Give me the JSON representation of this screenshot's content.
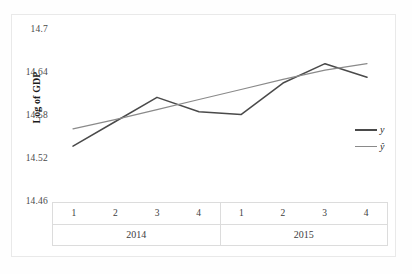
{
  "chart_data": {
    "type": "line",
    "title": "",
    "xlabel": "",
    "ylabel": "Log of GDP",
    "ylim": [
      14.46,
      14.7
    ],
    "yticks": [
      "14.7",
      "14.64",
      "14.58",
      "14.52",
      "14.46"
    ],
    "ytick_values": [
      14.7,
      14.64,
      14.58,
      14.52,
      14.46
    ],
    "grid": false,
    "legend_position": "right",
    "x_groups": [
      {
        "name": "2014",
        "categories": [
          "1",
          "2",
          "3",
          "4"
        ]
      },
      {
        "name": "2015",
        "categories": [
          "1",
          "2",
          "3",
          "4"
        ]
      }
    ],
    "x": [
      "2014 Q1",
      "2014 Q2",
      "2014 Q3",
      "2014 Q4",
      "2015 Q1",
      "2015 Q2",
      "2015 Q3",
      "2015 Q4"
    ],
    "series": [
      {
        "name": "y",
        "color": "#4a4a4a",
        "values": [
          14.538,
          14.572,
          14.606,
          14.586,
          14.582,
          14.626,
          14.653,
          14.634
        ]
      },
      {
        "name": "ŷ",
        "color": "#8a8a8a",
        "values": [
          14.562,
          14.575,
          14.589,
          14.603,
          14.617,
          14.631,
          14.644,
          14.653
        ]
      }
    ]
  },
  "axis": {
    "y_title": "Log of GDP"
  },
  "legend": {
    "items": [
      {
        "label": "y"
      },
      {
        "label": "ŷ"
      }
    ]
  },
  "colors": {
    "series_y": "#4a4a4a",
    "series_yhat": "#8a8a8a",
    "frame": "#e9e9e9",
    "table_border": "#dcdcdc",
    "text": "#3d3d3d"
  }
}
